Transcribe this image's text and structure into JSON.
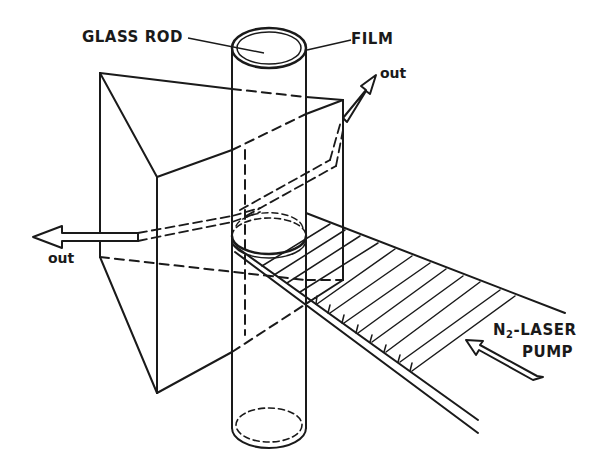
{
  "diagram": {
    "type": "optical-setup",
    "labels": {
      "glass_rod": "GLASS ROD",
      "film": "FILM",
      "out_right": "out",
      "out_left": "out",
      "pump_line1_prefix": "N",
      "pump_line1_sub": "2",
      "pump_line1_suffix": "-LASER",
      "pump_line2": "PUMP"
    },
    "components": [
      "glass-rod",
      "film",
      "prism",
      "pump-beam",
      "output-arrow-left",
      "output-arrow-right",
      "pump-arrow"
    ],
    "colors": {
      "ink": "#1a1a1a",
      "background": "#ffffff"
    }
  }
}
